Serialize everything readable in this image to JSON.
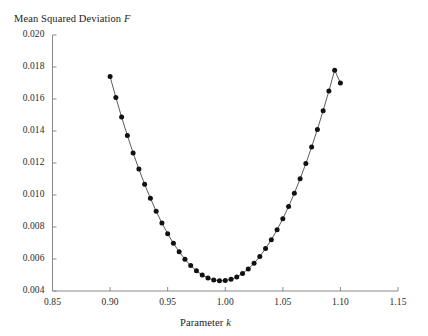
{
  "figure": {
    "title": "",
    "background": "#ffffff",
    "line_color": "#4a4a4a",
    "marker_color": "#111111",
    "axis_color": "#8a8a8a"
  },
  "axes": {
    "y_axis_title": "Mean Squared Deviation",
    "y_axis_symbol": "F",
    "x_axis_title": "Parameter",
    "x_axis_symbol": "k",
    "x_ticks": [
      "0.85",
      "0.90",
      "0.95",
      "1.00",
      "1.05",
      "1.10",
      "1.15"
    ],
    "y_ticks": [
      "0.004",
      "0.006",
      "0.008",
      "0.010",
      "0.012",
      "0.014",
      "0.016",
      "0.018",
      "0.020"
    ]
  },
  "chart_data": {
    "type": "scatter",
    "title": "",
    "xlabel": "Parameter k",
    "ylabel": "Mean Squared Deviation F",
    "xlim": [
      0.85,
      1.15
    ],
    "ylim": [
      0.004,
      0.02
    ],
    "grid": false,
    "legend": null,
    "marker": "filled-circle",
    "connected": true,
    "x": [
      0.9,
      0.905,
      0.91,
      0.915,
      0.92,
      0.925,
      0.93,
      0.935,
      0.94,
      0.945,
      0.95,
      0.955,
      0.96,
      0.965,
      0.97,
      0.975,
      0.98,
      0.985,
      0.99,
      0.995,
      1.0,
      1.005,
      1.01,
      1.015,
      1.02,
      1.025,
      1.03,
      1.035,
      1.04,
      1.045,
      1.05,
      1.055,
      1.06,
      1.065,
      1.07,
      1.075,
      1.08,
      1.085,
      1.09,
      1.095,
      1.1
    ],
    "y": [
      0.0174,
      0.0161,
      0.01487,
      0.01372,
      0.01263,
      0.01162,
      0.01067,
      0.0098,
      0.00899,
      0.00825,
      0.00758,
      0.00698,
      0.00645,
      0.00598,
      0.00559,
      0.00526,
      0.005,
      0.00481,
      0.00469,
      0.00464,
      0.00465,
      0.00473,
      0.00488,
      0.0051,
      0.00538,
      0.00573,
      0.00616,
      0.00665,
      0.0072,
      0.00783,
      0.00852,
      0.00928,
      0.01011,
      0.01101,
      0.01197,
      0.013,
      0.0141,
      0.01527,
      0.0165,
      0.0178,
      0.017
    ]
  }
}
